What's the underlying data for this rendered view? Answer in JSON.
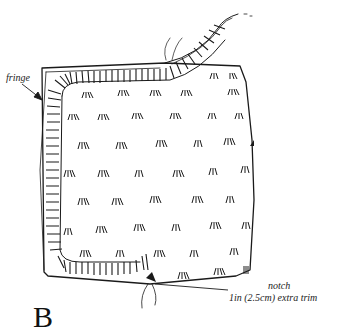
{
  "illustration": {
    "subject": "square rug with fringe and scattered tufts",
    "colors": {
      "ink": "#1a1a1a",
      "paper": "#ffffff"
    }
  },
  "labels": {
    "fringe": "fringe",
    "notch": "notch",
    "trim": "1in (2.5cm) extra trim"
  },
  "figure_letter": "B"
}
